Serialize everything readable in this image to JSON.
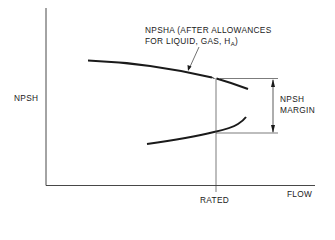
{
  "diagram": {
    "type": "npsh-margin-diagram",
    "axes": {
      "y_label": "NPSH",
      "x_label": "FLOW",
      "x_marker_label": "RATED"
    },
    "curves": {
      "upper_label_line1": "NPSHA (AFTER ALLOWANCES",
      "upper_label_line2_prefix": "FOR LIQUID, GAS, H",
      "upper_label_line2_subscript": "A",
      "upper_label_line2_suffix": ")"
    },
    "margin": {
      "label_line1": "NPSH",
      "label_line2": "MARGIN"
    },
    "colors": {
      "line": "#1a1a1a",
      "thin_line": "#333333",
      "background": "#ffffff"
    }
  }
}
